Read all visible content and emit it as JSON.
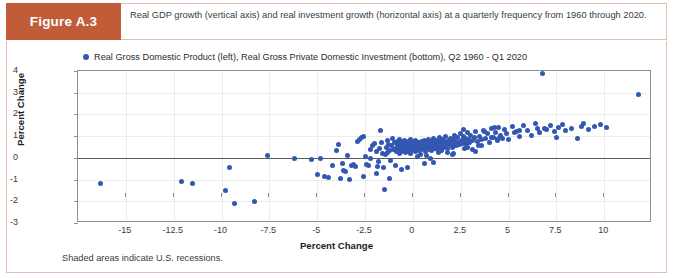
{
  "header": {
    "badge_label": "Figure A.3",
    "caption": "Real GDP growth (vertical axis) and real investment growth (horizontal axis) at a quarterly frequency from 1960 through 2020.",
    "badge_color": "#c15c38",
    "border_color": "#e3bfb2"
  },
  "footnote": "Shaded areas indicate U.S. recessions.",
  "chart_data": {
    "type": "scatter",
    "title": "",
    "legend": [
      "Real Gross Domestic Product (left), Real Gross Private Domestic Investment (bottom), Q2 1960 - Q1 2020"
    ],
    "legend_position": "top-left",
    "marker_color": "#3457b2",
    "xlabel": "Percent Change",
    "ylabel": "Percent Change",
    "xlim": [
      -17.5,
      12.5
    ],
    "ylim": [
      -3,
      4
    ],
    "xticks": [
      -15,
      -12.5,
      -10,
      -7.5,
      -5,
      -2.5,
      0,
      2.5,
      5,
      7.5,
      10
    ],
    "xtick_labels": [
      "-15",
      "-12.5",
      "-10",
      "-7.5",
      "-5",
      "-2.5",
      "0",
      "2.5",
      "5",
      "7.5",
      "10"
    ],
    "yticks": [
      -3,
      -2,
      -1,
      0,
      1,
      2,
      3,
      4
    ],
    "ytick_labels": [
      "-3",
      "-2",
      "-1",
      "0",
      "1",
      "2",
      "3",
      "4"
    ],
    "grid": true,
    "zero_line_y": 0,
    "x": [
      -16.3,
      -12.1,
      -11.5,
      -9.8,
      -9.6,
      -9.3,
      -8.3,
      -7.6,
      -6.2,
      -5.3,
      -5.0,
      -4.6,
      -4.4,
      -4.2,
      -4.0,
      -3.9,
      -3.7,
      -3.6,
      -3.5,
      -3.4,
      -3.3,
      -3.2,
      -3.1,
      -3.0,
      -2.9,
      -2.8,
      -2.7,
      -2.6,
      -2.5,
      -2.4,
      -2.3,
      -2.2,
      -2.1,
      -2.0,
      -1.9,
      -1.85,
      -1.8,
      -1.75,
      -1.7,
      -1.65,
      -1.6,
      -1.55,
      -1.5,
      -1.45,
      -1.4,
      -1.35,
      -1.3,
      -1.25,
      -1.2,
      -1.15,
      -1.1,
      -1.05,
      -1.0,
      -0.95,
      -0.9,
      -0.85,
      -0.8,
      -0.78,
      -0.75,
      -0.72,
      -0.7,
      -0.68,
      -0.65,
      -0.62,
      -0.6,
      -0.58,
      -0.55,
      -0.52,
      -0.5,
      -0.48,
      -0.45,
      -0.42,
      -0.4,
      -0.38,
      -0.35,
      -0.32,
      -0.3,
      -0.28,
      -0.25,
      -0.22,
      -0.2,
      -0.18,
      -0.15,
      -0.12,
      -0.1,
      -0.08,
      -0.05,
      -0.02,
      0.0,
      0.03,
      0.06,
      0.1,
      0.13,
      0.16,
      0.2,
      0.23,
      0.26,
      0.3,
      0.33,
      0.36,
      0.4,
      0.43,
      0.46,
      0.5,
      0.53,
      0.56,
      0.6,
      0.63,
      0.66,
      0.7,
      0.73,
      0.76,
      0.8,
      0.83,
      0.86,
      0.9,
      0.93,
      0.96,
      1.0,
      1.03,
      1.06,
      1.1,
      1.13,
      1.16,
      1.2,
      1.23,
      1.26,
      1.3,
      1.33,
      1.36,
      1.4,
      1.43,
      1.46,
      1.5,
      1.53,
      1.56,
      1.6,
      1.63,
      1.66,
      1.7,
      1.75,
      1.8,
      1.85,
      1.9,
      1.95,
      2.0,
      2.05,
      2.1,
      2.15,
      2.2,
      2.25,
      2.3,
      2.35,
      2.4,
      2.45,
      2.5,
      2.55,
      2.6,
      2.65,
      2.7,
      2.75,
      2.8,
      2.85,
      2.9,
      2.95,
      3.0,
      3.1,
      3.2,
      3.3,
      3.4,
      3.5,
      3.6,
      3.7,
      3.8,
      3.9,
      4.0,
      4.1,
      4.2,
      4.3,
      4.4,
      4.5,
      4.6,
      4.7,
      4.8,
      4.9,
      5.0,
      5.2,
      5.4,
      5.6,
      5.8,
      6.0,
      6.2,
      6.4,
      6.5,
      6.6,
      6.8,
      7.0,
      7.2,
      7.4,
      7.6,
      7.8,
      8.0,
      8.3,
      8.6,
      8.9,
      9.2,
      9.5,
      9.8,
      10.1,
      11.8,
      -0.6,
      0.4,
      1.1,
      2.2,
      3.3,
      -1.9,
      -2.6,
      0.9,
      1.8,
      2.7,
      3.6,
      4.4,
      5.3,
      -0.3,
      0.7,
      1.5,
      2.4,
      3.1,
      4.1,
      -1.2,
      -0.1,
      0.6,
      1.45,
      2.05,
      2.85,
      3.45,
      4.55,
      5.6,
      6.9,
      7.5,
      8.8,
      -4.8,
      -3.8,
      -2.2,
      -0.9,
      0.25,
      1.35,
      2.15,
      2.65,
      3.75,
      4.25
    ],
    "y": [
      -1.2,
      -1.1,
      -1.2,
      -1.5,
      -0.45,
      -2.1,
      -2.0,
      0.1,
      -0.02,
      -0.08,
      -0.75,
      -0.85,
      -0.9,
      -0.35,
      0.35,
      0.6,
      -0.25,
      -0.6,
      -0.65,
      0.1,
      -1.0,
      -0.35,
      -0.3,
      -0.42,
      0.75,
      0.85,
      0.95,
      1.0,
      0.05,
      -0.3,
      -0.35,
      0.4,
      0.55,
      0.65,
      0.3,
      -0.4,
      -0.15,
      0.45,
      1.25,
      0.7,
      0.2,
      -0.45,
      -1.45,
      0.15,
      0.5,
      0.8,
      0.25,
      0.6,
      0.35,
      -0.1,
      0.55,
      0.9,
      0.4,
      0.7,
      0.45,
      0.3,
      0.6,
      0.75,
      0.5,
      0.2,
      0.65,
      0.85,
      0.4,
      0.55,
      0.3,
      0.7,
      0.45,
      0.6,
      0.5,
      0.35,
      0.8,
      0.55,
      0.25,
      0.65,
      0.45,
      0.75,
      0.4,
      0.6,
      0.5,
      0.3,
      0.7,
      0.55,
      0.45,
      0.85,
      0.35,
      0.6,
      0.5,
      0.4,
      0.75,
      0.55,
      0.65,
      0.45,
      0.3,
      0.8,
      0.5,
      0.6,
      0.4,
      0.7,
      0.55,
      0.35,
      0.65,
      0.45,
      0.75,
      0.5,
      0.6,
      0.4,
      0.8,
      0.55,
      0.3,
      0.7,
      0.45,
      0.65,
      0.5,
      0.85,
      0.4,
      0.6,
      0.75,
      0.5,
      0.35,
      0.7,
      0.55,
      0.9,
      0.45,
      0.65,
      0.6,
      0.8,
      0.5,
      0.4,
      0.75,
      0.55,
      0.95,
      0.65,
      0.45,
      0.7,
      0.6,
      0.85,
      0.5,
      0.75,
      0.55,
      1.0,
      0.65,
      0.45,
      0.8,
      0.6,
      0.9,
      0.7,
      0.5,
      0.85,
      0.65,
      1.05,
      0.75,
      0.55,
      0.95,
      0.7,
      0.6,
      1.1,
      0.8,
      0.65,
      1.0,
      0.75,
      0.9,
      0.6,
      1.15,
      0.85,
      0.7,
      1.05,
      0.8,
      0.95,
      1.2,
      0.75,
      1.0,
      0.85,
      1.25,
      0.9,
      1.1,
      0.7,
      1.35,
      0.95,
      1.15,
      0.8,
      1.4,
      1.05,
      0.9,
      1.3,
      1.1,
      0.85,
      1.45,
      1.2,
      1.0,
      1.5,
      1.25,
      1.05,
      1.6,
      1.35,
      1.15,
      3.9,
      1.3,
      1.5,
      1.2,
      1.4,
      1.55,
      1.25,
      1.35,
      0.9,
      1.6,
      1.3,
      1.45,
      1.55,
      1.4,
      2.9,
      -0.55,
      0.15,
      -0.2,
      0.55,
      0.3,
      -0.7,
      -0.85,
      -0.05,
      0.25,
      0.45,
      0.55,
      0.85,
      1.15,
      -0.45,
      0.1,
      0.35,
      0.65,
      0.4,
      0.95,
      -0.95,
      0.2,
      -0.25,
      0.35,
      0.15,
      0.5,
      0.55,
      0.95,
      1.25,
      1.35,
      0.95,
      1.45,
      -0.05,
      -0.95,
      -0.05,
      -0.35,
      0.05,
      0.25,
      0.2,
      1.3,
      1.2,
      1.4
    ]
  }
}
